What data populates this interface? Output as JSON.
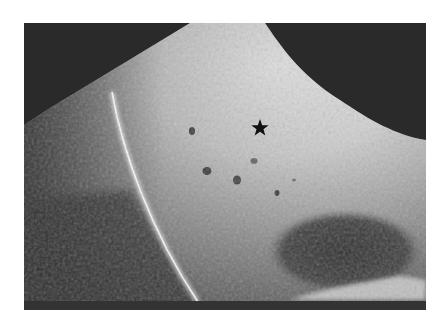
{
  "image": {
    "kind": "grayscale ultrasound scan",
    "frame": {
      "x": 24,
      "y": 23,
      "width": 402,
      "height": 287
    },
    "colors": {
      "page_background": "#ffffff",
      "frame_background": "#2a2a2a",
      "tissue_bright": "#e8e8e8",
      "tissue_mid": "#9a9a9a",
      "hypoechoic_region": "#3a3a3a",
      "marker": "#111111"
    },
    "annotations": [
      {
        "type": "star-marker",
        "x": 260,
        "y": 128
      }
    ],
    "features": {
      "echogenic_line": {
        "from": [
          115,
          95
        ],
        "to": [
          195,
          300
        ]
      },
      "hypoechoic_oval": {
        "cx": 345,
        "cy": 255,
        "rx": 75,
        "ry": 40
      },
      "bright_bottom_band": {
        "x1": 300,
        "x2": 420,
        "y": 290
      },
      "dark_foci": [
        [
          192,
          131
        ],
        [
          207,
          171
        ],
        [
          237,
          180
        ],
        [
          254,
          161
        ],
        [
          277,
          193
        ]
      ]
    }
  }
}
